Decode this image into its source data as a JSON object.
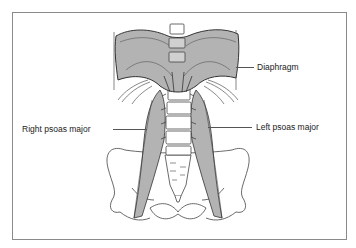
{
  "figure": {
    "labels": {
      "diaphragm": "Diaphragm",
      "right_psoas": "Right psoas major",
      "left_psoas": "Left psoas major"
    },
    "colors": {
      "muscle_fill": "#b3b3b3",
      "outline": "#333333",
      "frame": "#8a8a8a",
      "background": "#ffffff"
    }
  }
}
